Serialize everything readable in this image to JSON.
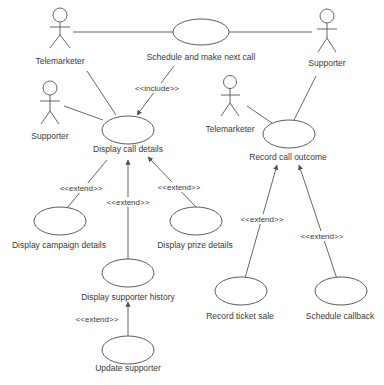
{
  "diagram": {
    "type": "uml-use-case",
    "actors": [
      {
        "id": "telemarketer_1",
        "label": "Telemarketer",
        "x": 60,
        "y": 16
      },
      {
        "id": "supporter_1",
        "label": "Supporter",
        "x": 327,
        "y": 16
      },
      {
        "id": "supporter_2",
        "label": "Supporter",
        "x": 50,
        "y": 88
      },
      {
        "id": "telemarketer_2",
        "label": "Telemarketer",
        "x": 230,
        "y": 82
      }
    ],
    "use_cases": [
      {
        "id": "schedule_next_call",
        "label": "Schedule and make next call"
      },
      {
        "id": "display_call_details",
        "label": "Display call details"
      },
      {
        "id": "record_call_outcome",
        "label": "Record call outcome"
      },
      {
        "id": "display_campaign_details",
        "label": "Display campaign details"
      },
      {
        "id": "display_prize_details",
        "label": "Display prize details"
      },
      {
        "id": "display_supporter_history",
        "label": "Display supporter history"
      },
      {
        "id": "update_supporter",
        "label": "Update supporter"
      },
      {
        "id": "record_ticket_sale",
        "label": "Record ticket sale"
      },
      {
        "id": "schedule_callback",
        "label": "Schedule callback"
      }
    ],
    "relationships": [
      {
        "from": "telemarketer_1",
        "to": "schedule_next_call",
        "type": "association"
      },
      {
        "from": "supporter_1",
        "to": "schedule_next_call",
        "type": "association"
      },
      {
        "from": "telemarketer_1",
        "to": "display_call_details",
        "type": "association"
      },
      {
        "from": "supporter_2",
        "to": "display_call_details",
        "type": "association"
      },
      {
        "from": "schedule_next_call",
        "to": "display_call_details",
        "type": "include",
        "label": "<<include>>"
      },
      {
        "from": "telemarketer_2",
        "to": "record_call_outcome",
        "type": "association"
      },
      {
        "from": "supporter_1",
        "to": "record_call_outcome",
        "type": "association"
      },
      {
        "from": "display_campaign_details",
        "to": "display_call_details",
        "type": "extend",
        "label": "<<extend>>"
      },
      {
        "from": "display_supporter_history",
        "to": "display_call_details",
        "type": "extend",
        "label": "<<extend>>"
      },
      {
        "from": "display_prize_details",
        "to": "display_call_details",
        "type": "extend",
        "label": "<<extend>>"
      },
      {
        "from": "update_supporter",
        "to": "display_supporter_history",
        "type": "extend",
        "label": "<<extend>>"
      },
      {
        "from": "record_ticket_sale",
        "to": "record_call_outcome",
        "type": "extend",
        "label": "<<extend>>"
      },
      {
        "from": "schedule_callback",
        "to": "record_call_outcome",
        "type": "extend",
        "label": "<<extend>>"
      }
    ]
  },
  "labels": {
    "include": "<<include>>",
    "extend": "<<extend>>"
  }
}
